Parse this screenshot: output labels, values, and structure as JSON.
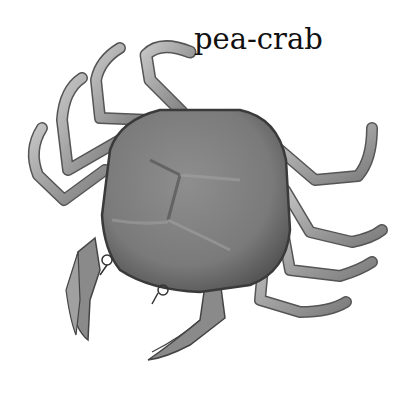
{
  "label": {
    "text": "pea-crab"
  },
  "illustration": {
    "subject": "pea crab",
    "style": "grayscale pencil illustration, top view",
    "colors": {
      "carapace": "#7d7d7d",
      "carapace_light": "#9a9a9a",
      "outline": "#3a3a3a",
      "legs": "#a8a8a8",
      "background": "#ffffff"
    }
  }
}
